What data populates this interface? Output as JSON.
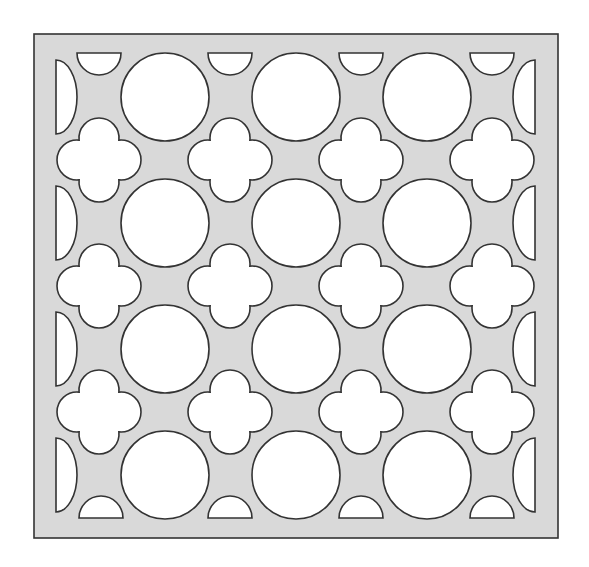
{
  "diagram": {
    "type": "decorative-lattice-pattern",
    "colors": {
      "background": "#ffffff",
      "panel_fill": "#d9d9d9",
      "cutout_fill": "#ffffff",
      "stroke": "#333333"
    },
    "panel": {
      "x": 34,
      "y": 34,
      "width": 524,
      "height": 504
    },
    "circles": {
      "radius": 44,
      "centers_x": [
        165,
        296,
        427
      ],
      "centers_y": [
        97,
        223,
        349,
        475
      ]
    },
    "quatrefoils": {
      "lobe_radius": 20,
      "lobe_offset": 22,
      "centers_x": [
        99,
        230,
        361,
        492
      ],
      "centers_y": [
        160,
        286,
        412
      ]
    },
    "top_half_circles": {
      "flat_y": 53,
      "radius": 22,
      "centers_x": [
        99,
        230,
        361,
        492
      ]
    },
    "bottom_half_circles": {
      "flat_y": 518,
      "radius": 22,
      "centers_x": [
        101,
        230,
        361,
        492
      ]
    },
    "left_half_discs": {
      "flat_x": 56,
      "rx": 21,
      "ry": 37,
      "centers_y": [
        97,
        223,
        349,
        475
      ]
    },
    "right_half_discs": {
      "flat_x": 535,
      "rx": 22,
      "ry": 37,
      "centers_y": [
        97,
        223,
        349,
        475
      ]
    }
  }
}
